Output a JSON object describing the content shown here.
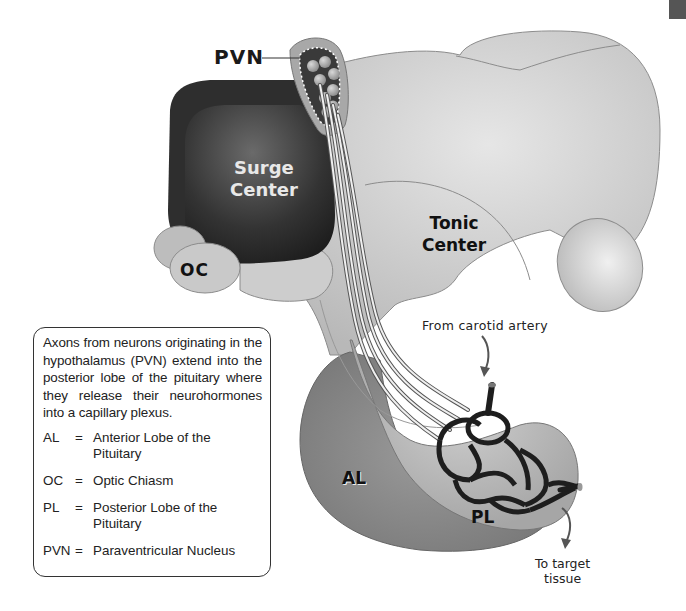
{
  "diagram": {
    "labels": {
      "pvn": "PVN",
      "surge_center_line1": "Surge",
      "surge_center_line2": "Center",
      "tonic_center_line1": "Tonic",
      "tonic_center_line2": "Center",
      "oc": "OC",
      "al": "AL",
      "pl": "PL",
      "from_carotid": "From carotid artery",
      "to_target_line1": "To target",
      "to_target_line2": "tissue"
    },
    "colors": {
      "surge_center": "#2a2a2a",
      "hypothalamus": "#c8c8c8",
      "anterior_lobe": "#8a8a8a",
      "posterior_lobe": "#b5b5b5",
      "capillary": "#1e1e1e",
      "pvn_nucleus": "#3a3a3a"
    }
  },
  "info_box": {
    "text": "Axons from neurons originating in the hypothalamus (PVN) extend into the posterior lobe of the pituitary where they release their neurohormones into a capillary plexus.",
    "legend": [
      {
        "abbr": "AL",
        "eq": "=",
        "definition": "Anterior Lobe of the Pituitary"
      },
      {
        "abbr": "OC",
        "eq": "=",
        "definition": "Optic Chiasm"
      },
      {
        "abbr": "PL",
        "eq": "=",
        "definition": "Posterior Lobe of the Pituitary"
      },
      {
        "abbr": "PVN",
        "eq": "=",
        "definition": "Paraventricular Nucleus"
      }
    ]
  }
}
